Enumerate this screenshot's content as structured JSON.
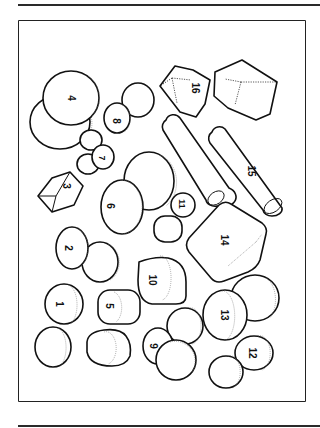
{
  "figure": {
    "frame_color": "#222222",
    "stroke_color": "#111111",
    "objects": [
      {
        "id": "1",
        "label": "1",
        "shape": "cylinder-cap"
      },
      {
        "id": "2",
        "label": "2",
        "shape": "cylinder-cap"
      },
      {
        "id": "3",
        "label": "3",
        "shape": "octahedron-crystal"
      },
      {
        "id": "4",
        "label": "4",
        "shape": "disc"
      },
      {
        "id": "5",
        "label": "5",
        "shape": "cylinder"
      },
      {
        "id": "6",
        "label": "6",
        "shape": "disc"
      },
      {
        "id": "7",
        "label": "7",
        "shape": "small-disc"
      },
      {
        "id": "8",
        "label": "8",
        "shape": "disc"
      },
      {
        "id": "9",
        "label": "9",
        "shape": "disc"
      },
      {
        "id": "10",
        "label": "10",
        "shape": "cylinder-cap"
      },
      {
        "id": "11",
        "label": "11",
        "shape": "small-disc"
      },
      {
        "id": "12",
        "label": "12",
        "shape": "disc"
      },
      {
        "id": "13",
        "label": "13",
        "shape": "disc"
      },
      {
        "id": "14",
        "label": "14",
        "shape": "rounded-cube"
      },
      {
        "id": "15",
        "label": "15",
        "shape": "long-cylinder"
      },
      {
        "id": "16",
        "label": "16",
        "shape": "cube-crystal"
      }
    ]
  }
}
